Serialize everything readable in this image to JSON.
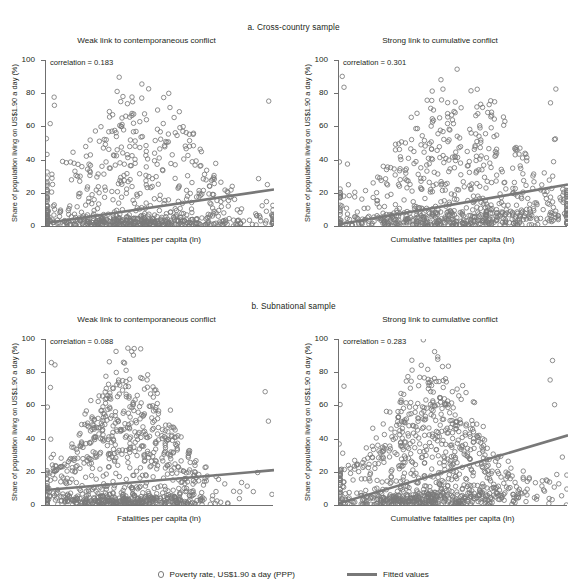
{
  "figure": {
    "groups": [
      {
        "label": "a. Cross-country sample"
      },
      {
        "label": "b. Subnational sample"
      }
    ],
    "legend": {
      "scatter_label": "Poverty rate, US$1.90 a day (PPP)",
      "line_label": "Fitted values",
      "marker_icon": "open-circle-marker",
      "line_icon": "solid-line-swatch"
    },
    "colors": {
      "marker_stroke": "#7a7a7a",
      "fit_line": "#787878",
      "axis": "#6f6f6f",
      "text": "#231f20",
      "background": "#ffffff"
    }
  },
  "chart_data": [
    {
      "type": "scatter",
      "panel": "a-left",
      "title": "Weak link to contemporaneous conflict",
      "group": "a. Cross-country sample",
      "annotation": "correlation = 0.183",
      "correlation": 0.183,
      "xlabel": "Fatalities per capita (ln)",
      "ylabel": "Share of population living on US$1.90 a day (%)",
      "ylim": [
        0,
        100
      ],
      "yticks": [
        0,
        20,
        40,
        60,
        80,
        100
      ],
      "ytick_labels": [
        "0",
        "20",
        "40",
        "60",
        "80",
        "100"
      ],
      "xlim": [
        0,
        100
      ],
      "xticks": [],
      "grid": false,
      "n_points": 760,
      "fit_line": {
        "x": [
          0,
          100
        ],
        "y": [
          1.8,
          22.0
        ]
      },
      "cluster": {
        "x_mode": 40,
        "x_spread": 26,
        "y_floor_share": 0.55,
        "description": "dense low-poverty mass along x-axis with tall plume of high values near x=30-45"
      }
    },
    {
      "type": "scatter",
      "panel": "a-right",
      "title": "Strong link to cumulative conflict",
      "group": "a. Cross-country sample",
      "annotation": "correlation = 0.301",
      "correlation": 0.301,
      "xlabel": "Cumulative fatalities per capita (ln)",
      "ylabel": "Share of population living on US$1.90 a day (%)",
      "ylim": [
        0,
        100
      ],
      "yticks": [
        0,
        20,
        40,
        60,
        80,
        100
      ],
      "ytick_labels": [
        "0",
        "20",
        "40",
        "60",
        "80",
        "100"
      ],
      "xlim": [
        0,
        100
      ],
      "xticks": [],
      "grid": false,
      "n_points": 780,
      "fit_line": {
        "x": [
          0,
          100
        ],
        "y": [
          1.0,
          25.0
        ]
      },
      "cluster": {
        "x_mode": 52,
        "x_spread": 28,
        "y_floor_share": 0.5,
        "description": "broad scatter with dense band near zero and diffuse upper cloud"
      }
    },
    {
      "type": "scatter",
      "panel": "b-left",
      "title": "Weak link to contemporaneous conflict",
      "group": "b. Subnational sample",
      "annotation": "correlation = 0.088",
      "correlation": 0.088,
      "xlabel": "Fatalities per capita (ln)",
      "ylabel": "Share of population living on US$1.90 a day (%)",
      "ylim": [
        0,
        100
      ],
      "yticks": [
        0,
        20,
        40,
        60,
        80,
        100
      ],
      "ytick_labels": [
        "0",
        "20",
        "40",
        "60",
        "80",
        "100"
      ],
      "xlim": [
        0,
        100
      ],
      "xticks": [],
      "grid": false,
      "n_points": 900,
      "fit_line": {
        "x": [
          0,
          100
        ],
        "y": [
          9.0,
          21.0
        ]
      },
      "cluster": {
        "x_mode": 36,
        "x_spread": 20,
        "y_floor_share": 0.38,
        "description": "vertical plume of points at x=28-45 spanning full y range, dense floor near 0"
      }
    },
    {
      "type": "scatter",
      "panel": "b-right",
      "title": "Strong link to cumulative conflict",
      "group": "b. Subnational sample",
      "annotation": "correlation = 0.283",
      "correlation": 0.283,
      "xlabel": "Cumulative fatalities per capita (ln)",
      "ylabel": "Share of population living on US$1.90 a day (%)",
      "ylim": [
        0,
        100
      ],
      "yticks": [
        0,
        20,
        40,
        60,
        80,
        100
      ],
      "ytick_labels": [
        "0",
        "20",
        "40",
        "60",
        "80",
        "100"
      ],
      "xlim": [
        0,
        100
      ],
      "xticks": [],
      "grid": false,
      "n_points": 920,
      "fit_line": {
        "x": [
          0,
          100
        ],
        "y": [
          1.0,
          42.0
        ]
      },
      "cluster": {
        "x_mode": 40,
        "x_spread": 22,
        "y_floor_share": 0.4,
        "description": "wedge-shaped spread widening to the right, steep fitted slope"
      }
    }
  ]
}
